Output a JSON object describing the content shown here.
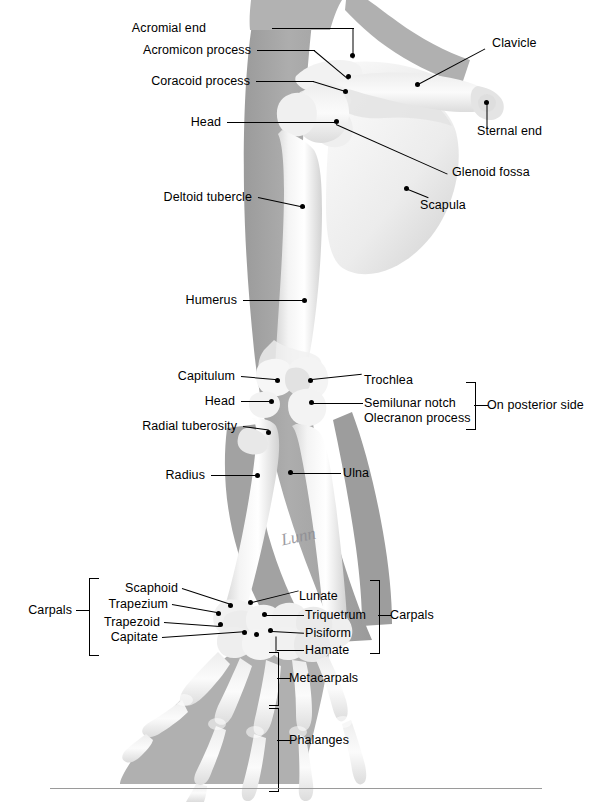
{
  "figure": {
    "signature": "Lunn",
    "colors": {
      "bone": "#f1f1f1",
      "bone_shade": "#d8d8d8",
      "soft_tissue": "#a8a8a8",
      "soft_tissue_dark": "#949494",
      "background": "#ffffff",
      "leader": "#000000",
      "rule": "#9a9a9a"
    }
  },
  "labels": {
    "acromial_end": "Acromial end",
    "acromion_process": "Acromicon process",
    "coracoid_process": "Coracoid process",
    "head_humerus": "Head",
    "deltoid_tubercle": "Deltoid tubercle",
    "humerus": "Humerus",
    "capitulum": "Capitulum",
    "head_radius": "Head",
    "radial_tuberosity": "Radial tuberosity",
    "radius": "Radius",
    "clavicle": "Clavicle",
    "sternal_end": "Sternal end",
    "glenoid_fossa": "Glenoid fossa",
    "scapula": "Scapula",
    "trochlea": "Trochlea",
    "semilunar_notch": "Semilunar notch",
    "olecranon_process": "Olecranon process",
    "on_posterior_side": "On posterior side",
    "ulna": "Ulna",
    "carpals_left": "Carpals",
    "carpals_right": "Carpals",
    "scaphoid": "Scaphoid",
    "trapezium": "Trapezium",
    "trapezoid": "Trapezoid",
    "capitate": "Capitate",
    "lunate": "Lunate",
    "triquetrum": "Triquetrum",
    "pisiform": "Pisiform",
    "hamate": "Hamate",
    "metacarpals": "Metacarpals",
    "phalanges": "Phalanges"
  }
}
